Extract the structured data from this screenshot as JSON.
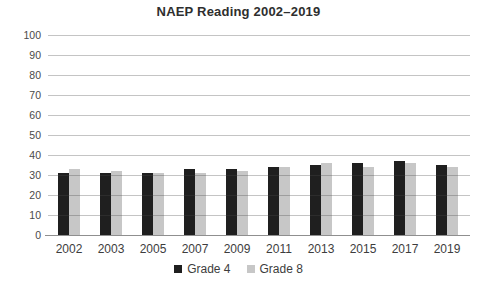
{
  "chart_data": {
    "type": "bar",
    "title": "NAEP Reading 2002–2019",
    "xlabel": "",
    "ylabel": "",
    "categories": [
      "2002",
      "2003",
      "2005",
      "2007",
      "2009",
      "2011",
      "2013",
      "2015",
      "2017",
      "2019"
    ],
    "series": [
      {
        "name": "Grade 4",
        "color": "#1f1f1f",
        "values": [
          31,
          31,
          31,
          33,
          33,
          34,
          35,
          36,
          37,
          35
        ]
      },
      {
        "name": "Grade 8",
        "color": "#c7c7c7",
        "values": [
          33,
          32,
          31,
          31,
          32,
          34,
          36,
          34,
          36,
          34
        ]
      }
    ],
    "ylim": [
      0,
      100
    ],
    "ytick_step": 10,
    "grid": true,
    "legend_position": "bottom"
  },
  "colors": {
    "background": "#ffffff",
    "gridline": "#bcbcbc",
    "axisline": "#8f8f8f",
    "text": "#3d3d3d",
    "title_text": "#2e2e2e"
  }
}
